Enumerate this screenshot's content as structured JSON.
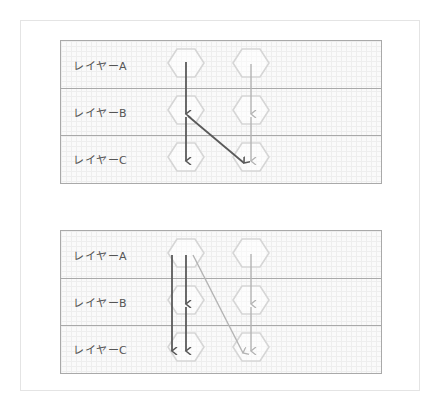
{
  "colors": {
    "hexagon_stroke": "#d6d6d6",
    "arrow_dark": "#5a5a5a",
    "arrow_light": "#b4b4b4",
    "divider": "#a9a9a9",
    "label": "#555555"
  },
  "diagrams": [
    {
      "id": "panel-1",
      "layers": [
        {
          "label": "レイヤーA"
        },
        {
          "label": "レイヤーB"
        },
        {
          "label": "レイヤーC"
        }
      ],
      "columns": 2,
      "arrows": [
        {
          "from": "A1",
          "to": "B1",
          "style": "dark"
        },
        {
          "from": "B1",
          "to": "C1",
          "style": "dark"
        },
        {
          "from": "B1",
          "to": "C2",
          "style": "dark"
        },
        {
          "from": "A2",
          "to": "B2",
          "style": "light"
        },
        {
          "from": "B2",
          "to": "C2",
          "style": "light"
        }
      ]
    },
    {
      "id": "panel-2",
      "layers": [
        {
          "label": "レイヤーA"
        },
        {
          "label": "レイヤーB"
        },
        {
          "label": "レイヤーC"
        }
      ],
      "columns": 2,
      "arrows": [
        {
          "from": "A1",
          "to": "C1",
          "style": "dark"
        },
        {
          "from": "A1",
          "to": "B1",
          "style": "dark"
        },
        {
          "from": "B1",
          "to": "C1",
          "style": "dark"
        },
        {
          "from": "A1",
          "to": "C2",
          "style": "light"
        },
        {
          "from": "A2",
          "to": "B2",
          "style": "light"
        },
        {
          "from": "B2",
          "to": "C2",
          "style": "light"
        }
      ]
    }
  ]
}
